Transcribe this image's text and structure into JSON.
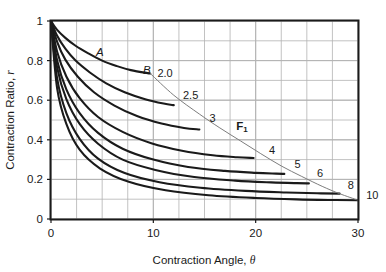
{
  "chart_data": {
    "type": "line",
    "title": "",
    "xlabel": "Contraction Angle, θ",
    "ylabel": "Contraction Ratio, r",
    "xlim": [
      0,
      30
    ],
    "ylim": [
      0,
      1
    ],
    "xticks": [
      0,
      10,
      20,
      30
    ],
    "xtick_labels": [
      "0",
      "10",
      "20",
      "30"
    ],
    "yticks": [
      0,
      0.2,
      0.4,
      0.6,
      0.8,
      1
    ],
    "ytick_labels": [
      "0",
      "0.2",
      "0.4",
      "0.6",
      "0.8",
      "1"
    ],
    "grid": true,
    "grid_minor_x_step": 2.5,
    "grid_minor_y_step": 0.1,
    "legend_position": "inline-end-labels",
    "annotations": [
      {
        "text": "A",
        "x": 4.4,
        "y": 0.845,
        "style": "italic"
      },
      {
        "text": "B",
        "x": 9.0,
        "y": 0.755,
        "style": "italic"
      },
      {
        "text": "F₁",
        "x": 18.1,
        "y": 0.47,
        "style": "bold"
      }
    ],
    "envelope": {
      "name": "F₁",
      "comment": "locus of curve end points",
      "points": [
        [
          9.7,
          0.735
        ],
        [
          12.0,
          0.625
        ],
        [
          14.5,
          0.53
        ],
        [
          16.5,
          0.46
        ],
        [
          18.5,
          0.395
        ],
        [
          20.5,
          0.33
        ],
        [
          22.5,
          0.268
        ],
        [
          24.5,
          0.215
        ],
        [
          26.5,
          0.165
        ],
        [
          28.2,
          0.128
        ],
        [
          30.0,
          0.095
        ]
      ]
    },
    "series": [
      {
        "name": "2.0",
        "label": "2.0",
        "label_x": 10.4,
        "label_y": 0.735,
        "x": [
          0,
          0.6,
          1.4,
          2.4,
          3.6,
          5.0,
          6.4,
          7.8,
          9.7
        ],
        "y": [
          1.0,
          0.955,
          0.915,
          0.875,
          0.838,
          0.8,
          0.773,
          0.752,
          0.735
        ]
      },
      {
        "name": "2.5",
        "label": "2.5",
        "label_x": 12.9,
        "label_y": 0.625,
        "x": [
          0,
          0.6,
          1.4,
          2.4,
          3.8,
          5.4,
          7.2,
          9.2,
          11.0,
          12.0
        ],
        "y": [
          1.0,
          0.925,
          0.86,
          0.8,
          0.74,
          0.685,
          0.64,
          0.605,
          0.583,
          0.575
        ]
      },
      {
        "name": "3",
        "label": "3",
        "label_x": 15.5,
        "label_y": 0.51,
        "x": [
          0,
          0.6,
          1.4,
          2.6,
          4.2,
          6.2,
          8.4,
          10.8,
          13.0,
          14.5
        ],
        "y": [
          1.0,
          0.895,
          0.805,
          0.72,
          0.64,
          0.573,
          0.52,
          0.482,
          0.46,
          0.452
        ]
      },
      {
        "name": "4",
        "label": "4",
        "label_x": 21.3,
        "label_y": 0.35,
        "x": [
          0,
          0.6,
          1.5,
          2.8,
          4.6,
          7.0,
          9.8,
          12.8,
          15.8,
          18.2,
          19.8
        ],
        "y": [
          1.0,
          0.845,
          0.72,
          0.61,
          0.515,
          0.44,
          0.383,
          0.345,
          0.322,
          0.312,
          0.308
        ]
      },
      {
        "name": "5",
        "label": "5",
        "label_x": 23.8,
        "label_y": 0.28,
        "x": [
          0,
          0.6,
          1.5,
          2.8,
          4.6,
          7.0,
          10.0,
          13.4,
          17.0,
          20.0,
          22.0,
          22.8
        ],
        "y": [
          1.0,
          0.8,
          0.655,
          0.535,
          0.435,
          0.355,
          0.3,
          0.263,
          0.243,
          0.233,
          0.229,
          0.228
        ]
      },
      {
        "name": "6",
        "label": "6",
        "label_x": 26.0,
        "label_y": 0.23,
        "x": [
          0,
          0.6,
          1.5,
          2.8,
          4.6,
          7.0,
          10.2,
          14.0,
          18.0,
          21.5,
          24.0,
          25.2
        ],
        "y": [
          1.0,
          0.765,
          0.605,
          0.48,
          0.38,
          0.3,
          0.248,
          0.212,
          0.194,
          0.185,
          0.181,
          0.18
        ]
      },
      {
        "name": "8",
        "label": "8",
        "label_x": 29.0,
        "label_y": 0.17,
        "x": [
          0,
          0.6,
          1.5,
          2.8,
          4.6,
          7.2,
          10.6,
          14.6,
          19.0,
          23.0,
          26.0,
          28.2
        ],
        "y": [
          1.0,
          0.71,
          0.535,
          0.405,
          0.305,
          0.232,
          0.186,
          0.158,
          0.142,
          0.134,
          0.13,
          0.128
        ]
      },
      {
        "name": "10",
        "label": "10",
        "label_x": 30.8,
        "label_y": 0.12,
        "x": [
          0,
          0.6,
          1.5,
          2.8,
          4.8,
          7.6,
          11.2,
          15.4,
          20.0,
          24.0,
          27.5,
          30.0
        ],
        "y": [
          1.0,
          0.66,
          0.48,
          0.35,
          0.255,
          0.188,
          0.145,
          0.12,
          0.106,
          0.099,
          0.096,
          0.095
        ]
      }
    ]
  },
  "figure": {
    "axis_x_title_main": "Contraction Angle, ",
    "axis_x_title_symbol": "θ",
    "axis_y_title_main": "Contraction Ratio, ",
    "axis_y_title_symbol": "r"
  },
  "colors": {
    "curve": "#1a1a1a",
    "envelope": "#7d7d7d",
    "grid": "#b3b3b3",
    "frame": "#1a1a1a",
    "background": "#ffffff",
    "text": "#1a1a1a"
  }
}
